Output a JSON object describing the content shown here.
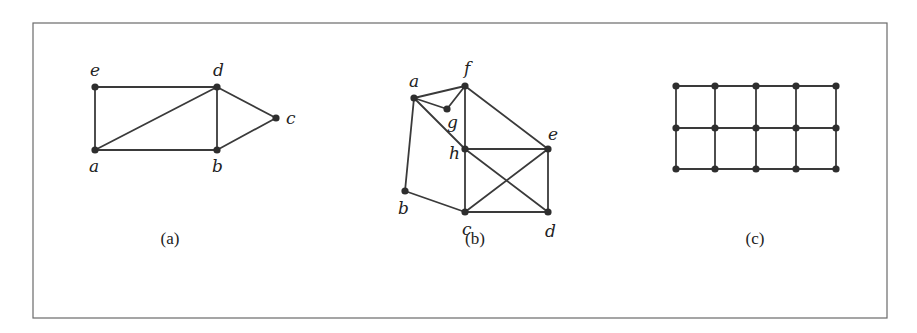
{
  "figure": {
    "frame": {
      "x": 33,
      "y": 23,
      "w": 854,
      "h": 295
    },
    "colors": {
      "edge": "#3a3a3a",
      "node": "#2e2e2e",
      "frame": "#6a6a6a",
      "text": "#222222"
    },
    "graphs": [
      {
        "id": "a",
        "caption": "(a)",
        "caption_pos": [
          170,
          244
        ],
        "nodes": [
          {
            "name": "e",
            "x": 95,
            "y": 87,
            "lx": 90,
            "ly": 76
          },
          {
            "name": "d",
            "x": 217,
            "y": 87,
            "lx": 213,
            "ly": 76
          },
          {
            "name": "c",
            "x": 276,
            "y": 118,
            "lx": 286,
            "ly": 124
          },
          {
            "name": "a",
            "x": 95,
            "y": 150,
            "lx": 89,
            "ly": 172
          },
          {
            "name": "b",
            "x": 217,
            "y": 150,
            "lx": 212,
            "ly": 172
          }
        ],
        "edges": [
          [
            "e",
            "d"
          ],
          [
            "e",
            "a"
          ],
          [
            "a",
            "d"
          ],
          [
            "a",
            "b"
          ],
          [
            "d",
            "b"
          ],
          [
            "d",
            "c"
          ],
          [
            "b",
            "c"
          ]
        ]
      },
      {
        "id": "b",
        "caption": "(b)",
        "caption_pos": [
          475,
          244
        ],
        "nodes": [
          {
            "name": "a",
            "x": 414,
            "y": 98,
            "lx": 409,
            "ly": 87
          },
          {
            "name": "f",
            "x": 465,
            "y": 86,
            "lx": 464,
            "ly": 74
          },
          {
            "name": "g",
            "x": 447,
            "y": 109,
            "lx": 447,
            "ly": 128
          },
          {
            "name": "h",
            "x": 465,
            "y": 149,
            "lx": 449,
            "ly": 159
          },
          {
            "name": "e",
            "x": 548,
            "y": 149,
            "lx": 548,
            "ly": 140
          },
          {
            "name": "b",
            "x": 405,
            "y": 191,
            "lx": 398,
            "ly": 214
          },
          {
            "name": "c",
            "x": 465,
            "y": 212,
            "lx": 462,
            "ly": 235
          },
          {
            "name": "d",
            "x": 548,
            "y": 212,
            "lx": 545,
            "ly": 237
          }
        ],
        "edges": [
          [
            "a",
            "f"
          ],
          [
            "a",
            "g"
          ],
          [
            "g",
            "f"
          ],
          [
            "a",
            "b"
          ],
          [
            "a",
            "h"
          ],
          [
            "h",
            "d"
          ],
          [
            "f",
            "h"
          ],
          [
            "f",
            "e"
          ],
          [
            "h",
            "e"
          ],
          [
            "h",
            "c"
          ],
          [
            "e",
            "d"
          ],
          [
            "c",
            "d"
          ],
          [
            "c",
            "e"
          ],
          [
            "b",
            "c"
          ]
        ]
      },
      {
        "id": "c",
        "caption": "(c)",
        "caption_pos": [
          755,
          244
        ],
        "grid": {
          "cols": [
            676,
            715,
            756,
            796,
            836
          ],
          "rows": [
            86,
            128,
            169
          ]
        }
      }
    ]
  }
}
